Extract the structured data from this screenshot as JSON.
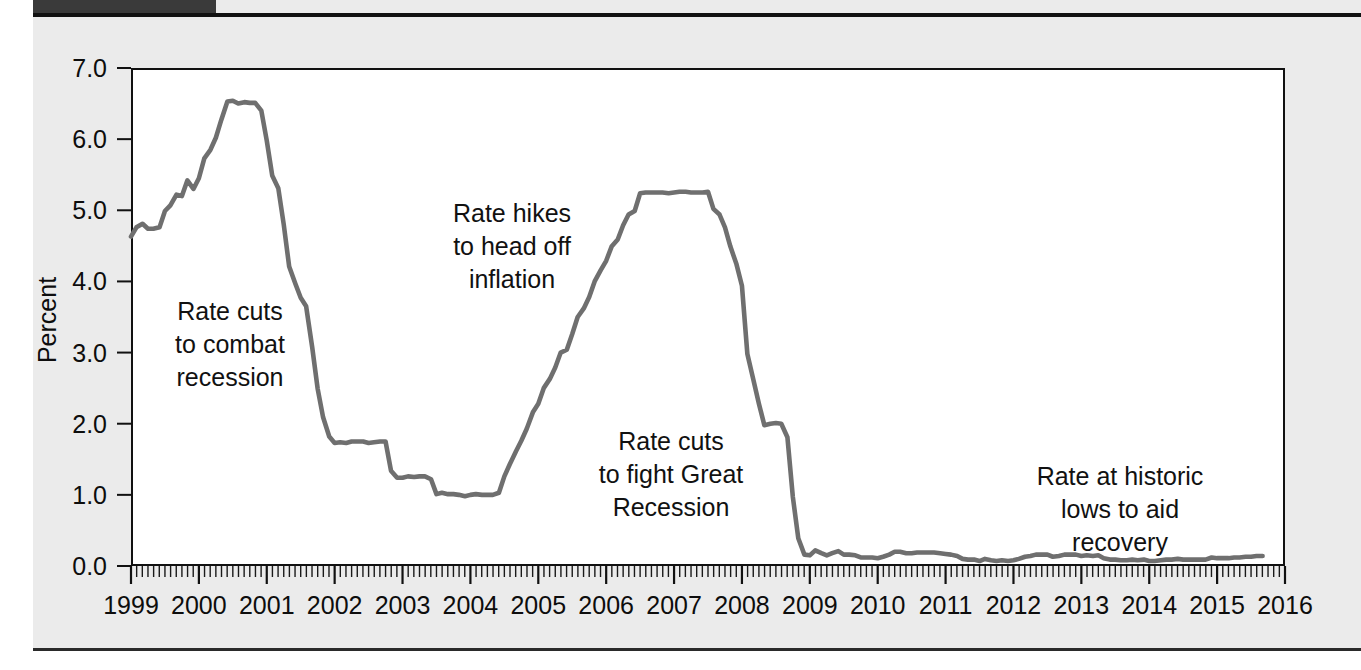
{
  "page": {
    "background_color": "#ebebeb",
    "header_band_color": "#3a3a3a"
  },
  "chart_data": {
    "type": "line",
    "title": "",
    "xlabel": "",
    "ylabel": "Percent",
    "ylim": [
      0.0,
      7.0
    ],
    "xlim": [
      1999.0,
      2016.0
    ],
    "grid": false,
    "legend": "none",
    "line_color": "#6f6f6f",
    "ytick_labels": [
      "7.0",
      "6.0",
      "5.0",
      "4.0",
      "3.0",
      "2.0",
      "1.0",
      "0.0"
    ],
    "ytick_values": [
      7.0,
      6.0,
      5.0,
      4.0,
      3.0,
      2.0,
      1.0,
      0.0
    ],
    "xtick_labels": [
      "1999",
      "2000",
      "2001",
      "2002",
      "2003",
      "2004",
      "2005",
      "2006",
      "2007",
      "2008",
      "2009",
      "2010",
      "2011",
      "2012",
      "2013",
      "2014",
      "2015",
      "2016"
    ],
    "xtick_values": [
      1999,
      2000,
      2001,
      2002,
      2003,
      2004,
      2005,
      2006,
      2007,
      2008,
      2009,
      2010,
      2011,
      2012,
      2013,
      2014,
      2015,
      2016
    ],
    "minor_ticks_per_year": 12,
    "series": [
      {
        "name": "Federal funds rate",
        "x": [
          1999.0,
          1999.08,
          1999.17,
          1999.25,
          1999.33,
          1999.42,
          1999.5,
          1999.58,
          1999.67,
          1999.75,
          1999.83,
          1999.92,
          2000.0,
          2000.08,
          2000.17,
          2000.25,
          2000.33,
          2000.42,
          2000.5,
          2000.58,
          2000.67,
          2000.75,
          2000.83,
          2000.92,
          2001.0,
          2001.08,
          2001.17,
          2001.25,
          2001.33,
          2001.42,
          2001.5,
          2001.58,
          2001.67,
          2001.75,
          2001.83,
          2001.92,
          2002.0,
          2002.08,
          2002.17,
          2002.25,
          2002.33,
          2002.42,
          2002.5,
          2002.58,
          2002.67,
          2002.75,
          2002.83,
          2002.92,
          2003.0,
          2003.08,
          2003.17,
          2003.25,
          2003.33,
          2003.42,
          2003.5,
          2003.58,
          2003.67,
          2003.75,
          2003.83,
          2003.92,
          2004.0,
          2004.08,
          2004.17,
          2004.25,
          2004.33,
          2004.42,
          2004.5,
          2004.58,
          2004.67,
          2004.75,
          2004.83,
          2004.92,
          2005.0,
          2005.08,
          2005.17,
          2005.25,
          2005.33,
          2005.42,
          2005.5,
          2005.58,
          2005.67,
          2005.75,
          2005.83,
          2005.92,
          2006.0,
          2006.08,
          2006.17,
          2006.25,
          2006.33,
          2006.42,
          2006.5,
          2006.58,
          2006.67,
          2006.75,
          2006.83,
          2006.92,
          2007.0,
          2007.08,
          2007.17,
          2007.25,
          2007.33,
          2007.42,
          2007.5,
          2007.58,
          2007.67,
          2007.75,
          2007.83,
          2007.92,
          2008.0,
          2008.08,
          2008.17,
          2008.25,
          2008.33,
          2008.42,
          2008.5,
          2008.58,
          2008.67,
          2008.75,
          2008.83,
          2008.92,
          2009.0,
          2009.08,
          2009.17,
          2009.25,
          2009.33,
          2009.42,
          2009.5,
          2009.58,
          2009.67,
          2009.75,
          2009.83,
          2009.92,
          2010.0,
          2010.08,
          2010.17,
          2010.25,
          2010.33,
          2010.42,
          2010.5,
          2010.58,
          2010.67,
          2010.75,
          2010.83,
          2010.92,
          2011.0,
          2011.08,
          2011.17,
          2011.25,
          2011.33,
          2011.42,
          2011.5,
          2011.58,
          2011.67,
          2011.75,
          2011.83,
          2011.92,
          2012.0,
          2012.08,
          2012.17,
          2012.25,
          2012.33,
          2012.42,
          2012.5,
          2012.58,
          2012.67,
          2012.75,
          2012.83,
          2012.92,
          2013.0,
          2013.08,
          2013.17,
          2013.25,
          2013.33,
          2013.42,
          2013.5,
          2013.58,
          2013.67,
          2013.75,
          2013.83,
          2013.92,
          2014.0,
          2014.08,
          2014.17,
          2014.25,
          2014.33,
          2014.42,
          2014.5,
          2014.58,
          2014.67,
          2014.75,
          2014.83,
          2014.92,
          2015.0,
          2015.08,
          2015.17,
          2015.25,
          2015.33,
          2015.42,
          2015.5,
          2015.58,
          2015.67
        ],
        "values": [
          4.63,
          4.76,
          4.81,
          4.74,
          4.74,
          4.76,
          4.99,
          5.07,
          5.22,
          5.2,
          5.42,
          5.3,
          5.45,
          5.73,
          5.85,
          6.02,
          6.27,
          6.53,
          6.54,
          6.5,
          6.52,
          6.51,
          6.51,
          6.4,
          5.98,
          5.49,
          5.31,
          4.8,
          4.21,
          3.97,
          3.77,
          3.65,
          3.07,
          2.49,
          2.09,
          1.82,
          1.73,
          1.74,
          1.73,
          1.75,
          1.75,
          1.75,
          1.73,
          1.74,
          1.75,
          1.75,
          1.34,
          1.24,
          1.24,
          1.26,
          1.25,
          1.26,
          1.26,
          1.22,
          1.01,
          1.03,
          1.01,
          1.01,
          1.0,
          0.98,
          1.0,
          1.01,
          1.0,
          1.0,
          1.0,
          1.03,
          1.26,
          1.43,
          1.61,
          1.76,
          1.93,
          2.16,
          2.28,
          2.5,
          2.63,
          2.79,
          3.0,
          3.04,
          3.26,
          3.5,
          3.62,
          3.78,
          4.0,
          4.16,
          4.29,
          4.49,
          4.59,
          4.79,
          4.94,
          4.99,
          5.24,
          5.25,
          5.25,
          5.25,
          5.25,
          5.24,
          5.25,
          5.26,
          5.26,
          5.25,
          5.25,
          5.25,
          5.26,
          5.02,
          4.94,
          4.76,
          4.49,
          4.24,
          3.94,
          2.98,
          2.61,
          2.28,
          1.98,
          2.0,
          2.01,
          2.0,
          1.81,
          0.97,
          0.39,
          0.16,
          0.15,
          0.22,
          0.18,
          0.15,
          0.18,
          0.21,
          0.16,
          0.16,
          0.15,
          0.12,
          0.12,
          0.12,
          0.11,
          0.13,
          0.16,
          0.2,
          0.2,
          0.18,
          0.18,
          0.19,
          0.19,
          0.19,
          0.19,
          0.18,
          0.17,
          0.16,
          0.14,
          0.1,
          0.09,
          0.09,
          0.07,
          0.1,
          0.08,
          0.07,
          0.08,
          0.07,
          0.08,
          0.1,
          0.13,
          0.14,
          0.16,
          0.16,
          0.16,
          0.13,
          0.14,
          0.16,
          0.16,
          0.16,
          0.14,
          0.15,
          0.14,
          0.15,
          0.11,
          0.09,
          0.09,
          0.08,
          0.08,
          0.09,
          0.08,
          0.09,
          0.07,
          0.07,
          0.08,
          0.09,
          0.09,
          0.1,
          0.09,
          0.09,
          0.09,
          0.09,
          0.09,
          0.12,
          0.11,
          0.11,
          0.11,
          0.12,
          0.12,
          0.13,
          0.13,
          0.14,
          0.14
        ]
      }
    ],
    "annotations": [
      {
        "name": "rate-cuts-recession",
        "lines": [
          "Rate cuts",
          "to combat",
          "recession"
        ],
        "x_px": 230,
        "y_px": 320
      },
      {
        "name": "rate-hikes-inflation",
        "lines": [
          "Rate hikes",
          "to head off",
          "inflation"
        ],
        "x_px": 512,
        "y_px": 222
      },
      {
        "name": "rate-cuts-great-recession",
        "lines": [
          "Rate cuts",
          "to fight Great",
          "Recession"
        ],
        "x_px": 671,
        "y_px": 450
      },
      {
        "name": "rate-historic-lows",
        "lines": [
          "Rate at historic",
          "lows to aid",
          "recovery"
        ],
        "x_px": 1120,
        "y_px": 485
      }
    ]
  }
}
